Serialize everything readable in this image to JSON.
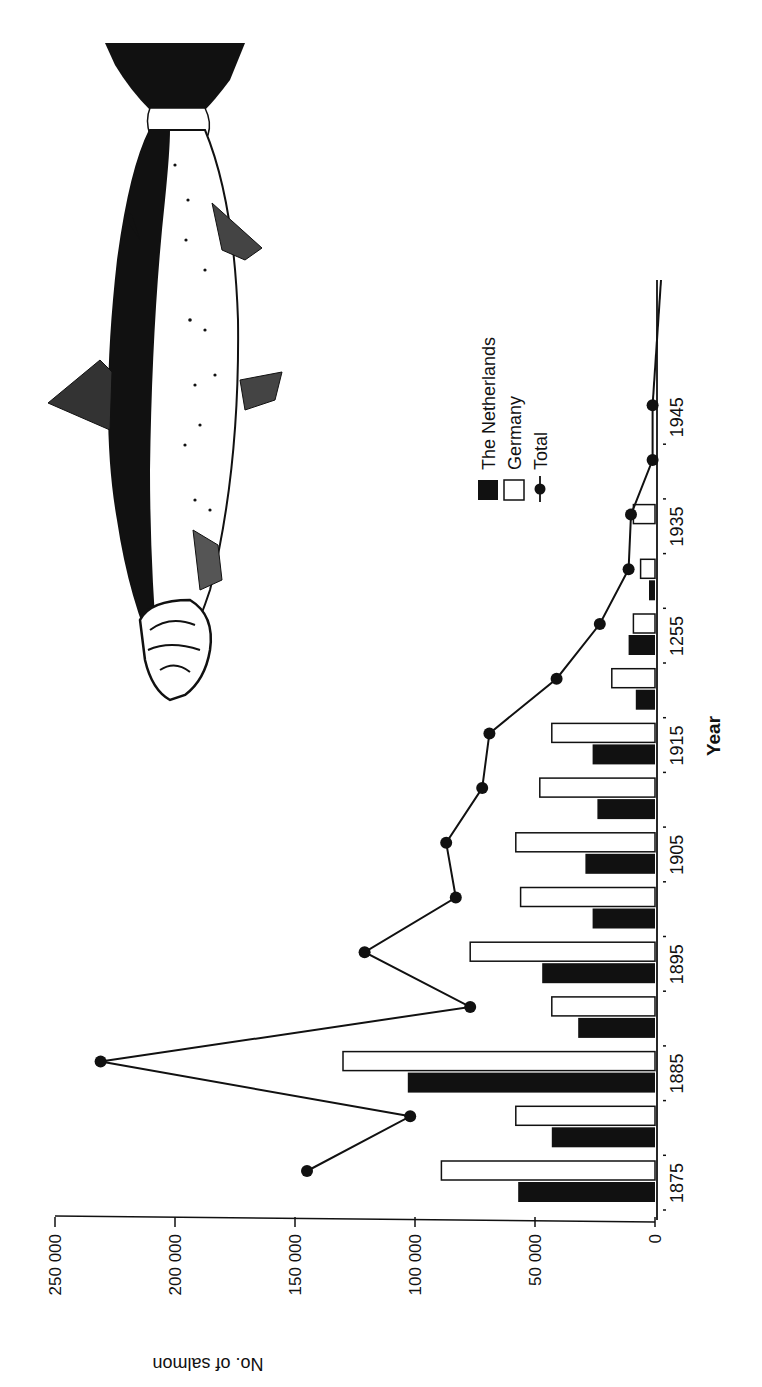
{
  "chart_data": {
    "type": "bar",
    "orientation": "rotated-90-clockwise",
    "title": "",
    "xlabel": "Year",
    "ylabel": "No. of salmon",
    "ylim": [
      0,
      250000
    ],
    "yticks": [
      0,
      50000,
      100000,
      150000,
      200000,
      250000
    ],
    "ytick_labels": [
      "0",
      "50 000",
      "100 000",
      "150 000",
      "200 000",
      "250 000"
    ],
    "categories": [
      "1875",
      "1880",
      "1885",
      "1890",
      "1895",
      "1900",
      "1905",
      "1910",
      "1915",
      "1920",
      "1925",
      "1930",
      "1935",
      "1940",
      "1945"
    ],
    "xtick_labels": [
      "1875",
      "1885",
      "1895",
      "1905",
      "1915",
      "1255",
      "1935",
      "1945"
    ],
    "xtick_label_positions": [
      "1875",
      "1885",
      "1895",
      "1905",
      "1915",
      "1925",
      "1935",
      "1945"
    ],
    "series": [
      {
        "name": "The Netherlands",
        "type": "bar",
        "fill": "#111111",
        "values": [
          57000,
          43000,
          103000,
          32000,
          47000,
          26000,
          29000,
          24000,
          26000,
          8000,
          11000,
          2500,
          0,
          null,
          null
        ]
      },
      {
        "name": "Germany",
        "type": "bar",
        "fill": "#ffffff",
        "values": [
          89000,
          58000,
          130000,
          43000,
          77000,
          56000,
          58000,
          48000,
          43000,
          18000,
          9000,
          6000,
          9000,
          null,
          null
        ]
      },
      {
        "name": "Total",
        "type": "line",
        "marker": "circle",
        "values": [
          145000,
          102000,
          231000,
          77000,
          121000,
          83000,
          87000,
          72000,
          69000,
          41000,
          23000,
          11000,
          10000,
          1000,
          1000
        ]
      }
    ],
    "legend": {
      "position": "upper-right (rotated)",
      "entries": [
        "The Netherlands",
        "Germany",
        "Total"
      ]
    },
    "grid": false,
    "annotations": [
      "Illustration of a salmon above the chart"
    ]
  },
  "figure": {
    "illustration": "salmon-drawing"
  }
}
